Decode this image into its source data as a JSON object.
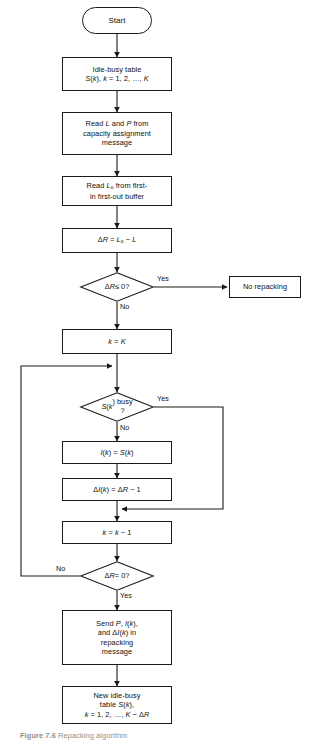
{
  "figure": {
    "caption_number": "Figure 7.6",
    "caption_text": "Repacking algorithm",
    "stroke_color": "#1a1a1a",
    "text_color": "#111111",
    "background": "#ffffff"
  },
  "nodes": {
    "start": {
      "label": "Start",
      "shape": "terminator"
    },
    "idle_busy_table": {
      "label": "Idle-busy table\nS(k), k = 1, 2, …, K",
      "shape": "process"
    },
    "read_l_p": {
      "label": "Read L and P from\ncapacity assignment\nmessage",
      "shape": "process"
    },
    "read_lo": {
      "label": "Read Lo from first-\nin first-out buffer",
      "shape": "process"
    },
    "delta_r_assign": {
      "label": "ΔR = Lo − L",
      "shape": "process"
    },
    "decision_delta_r_le_0": {
      "label": "ΔR ≤ 0?",
      "shape": "decision"
    },
    "no_repacking": {
      "label": "No repacking",
      "shape": "process"
    },
    "k_equals_K": {
      "label": "k = K",
      "shape": "process"
    },
    "decision_sk_busy": {
      "label": "S(k) busy\n?",
      "shape": "decision"
    },
    "ik_assign": {
      "label": "I(k) = S(k)",
      "shape": "process"
    },
    "delta_ik_assign": {
      "label": "ΔI(k) = ΔR − 1",
      "shape": "process"
    },
    "k_decrement": {
      "label": "k = k − 1",
      "shape": "process"
    },
    "decision_delta_r_eq_0": {
      "label": "ΔR = 0?",
      "shape": "decision"
    },
    "send_repacking": {
      "label": "Send P, I(k),\nand ΔI(k) in\nrepacking\nmessage",
      "shape": "process"
    },
    "new_idle_busy": {
      "label": "New idle-busy\ntable S(k),\nk = 1, 2, …, K − ΔR",
      "shape": "process"
    }
  },
  "edge_labels": {
    "yes_delta_r_le_0": "Yes",
    "no_delta_r_le_0": "No",
    "yes_sk_busy": "Yes",
    "no_sk_busy": "No",
    "no_delta_r_eq_0": "No",
    "yes_delta_r_eq_0": "Yes"
  },
  "chart_data": {
    "type": "diagram",
    "diagram_type": "flowchart",
    "title": "Repacking algorithm",
    "nodes": [
      {
        "id": "start",
        "type": "terminator",
        "text": "Start"
      },
      {
        "id": "idle_busy_table",
        "type": "process",
        "text": "Idle-busy table S(k), k = 1, 2, …, K"
      },
      {
        "id": "read_l_p",
        "type": "process",
        "text": "Read L and P from capacity assignment message"
      },
      {
        "id": "read_lo",
        "type": "process",
        "text": "Read Lo from first-in first-out buffer"
      },
      {
        "id": "delta_r_assign",
        "type": "process",
        "text": "ΔR = Lo − L"
      },
      {
        "id": "decision_delta_r_le_0",
        "type": "decision",
        "text": "ΔR ≤ 0?"
      },
      {
        "id": "no_repacking",
        "type": "process",
        "text": "No repacking"
      },
      {
        "id": "k_equals_K",
        "type": "process",
        "text": "k = K"
      },
      {
        "id": "decision_sk_busy",
        "type": "decision",
        "text": "S(k) busy ?"
      },
      {
        "id": "ik_assign",
        "type": "process",
        "text": "I(k) = S(k)"
      },
      {
        "id": "delta_ik_assign",
        "type": "process",
        "text": "ΔI(k) = ΔR − 1"
      },
      {
        "id": "k_decrement",
        "type": "process",
        "text": "k = k − 1"
      },
      {
        "id": "decision_delta_r_eq_0",
        "type": "decision",
        "text": "ΔR = 0?"
      },
      {
        "id": "send_repacking",
        "type": "process",
        "text": "Send P, I(k), and ΔI(k) in repacking message"
      },
      {
        "id": "new_idle_busy",
        "type": "process",
        "text": "New idle-busy table S(k), k = 1, 2, …, K − ΔR"
      }
    ],
    "edges": [
      {
        "from": "start",
        "to": "idle_busy_table",
        "label": ""
      },
      {
        "from": "idle_busy_table",
        "to": "read_l_p",
        "label": ""
      },
      {
        "from": "read_l_p",
        "to": "read_lo",
        "label": ""
      },
      {
        "from": "read_lo",
        "to": "delta_r_assign",
        "label": ""
      },
      {
        "from": "delta_r_assign",
        "to": "decision_delta_r_le_0",
        "label": ""
      },
      {
        "from": "decision_delta_r_le_0",
        "to": "no_repacking",
        "label": "Yes"
      },
      {
        "from": "decision_delta_r_le_0",
        "to": "k_equals_K",
        "label": "No"
      },
      {
        "from": "k_equals_K",
        "to": "decision_sk_busy",
        "label": ""
      },
      {
        "from": "decision_sk_busy",
        "to": "k_decrement",
        "label": "Yes"
      },
      {
        "from": "decision_sk_busy",
        "to": "ik_assign",
        "label": "No"
      },
      {
        "from": "ik_assign",
        "to": "delta_ik_assign",
        "label": ""
      },
      {
        "from": "delta_ik_assign",
        "to": "k_decrement",
        "label": ""
      },
      {
        "from": "k_decrement",
        "to": "decision_delta_r_eq_0",
        "label": ""
      },
      {
        "from": "decision_delta_r_eq_0",
        "to": "decision_sk_busy",
        "label": "No"
      },
      {
        "from": "decision_delta_r_eq_0",
        "to": "send_repacking",
        "label": "Yes"
      },
      {
        "from": "send_repacking",
        "to": "new_idle_busy",
        "label": ""
      }
    ]
  }
}
